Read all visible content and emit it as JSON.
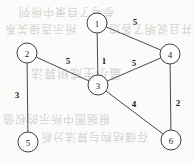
{
  "figure": {
    "width": 194,
    "height": 164,
    "background_color": "#fbfbfa",
    "node_fill_color": "#ffffff",
    "node_stroke_color": "#3f3f3f",
    "edge_color": "#4b4b4b",
    "label_color": "#1f1f1f"
  },
  "chart_data": {
    "type": "diagram",
    "subtype": "node-link-graph",
    "directed": false,
    "weighted": true,
    "title": "",
    "nodes": [
      {
        "id": "1",
        "label": "1",
        "x": 97,
        "y": 23,
        "r": 10
      },
      {
        "id": "2",
        "label": "2",
        "x": 27,
        "y": 53,
        "r": 10
      },
      {
        "id": "3",
        "label": "3",
        "x": 98,
        "y": 85,
        "r": 10
      },
      {
        "id": "4",
        "label": "4",
        "x": 170,
        "y": 54,
        "r": 10
      },
      {
        "id": "5",
        "label": "5",
        "x": 28,
        "y": 142,
        "r": 10
      },
      {
        "id": "6",
        "label": "6",
        "x": 171,
        "y": 140,
        "r": 10
      }
    ],
    "edges": [
      {
        "source": "1",
        "target": "4",
        "weight": 5,
        "label": "5",
        "label_x": 135,
        "label_y": 22
      },
      {
        "source": "1",
        "target": "3",
        "weight": 1,
        "label": "1",
        "label_x": 104,
        "label_y": 61
      },
      {
        "source": "2",
        "target": "3",
        "weight": 5,
        "label": "5",
        "label_x": 68,
        "label_y": 61
      },
      {
        "source": "2",
        "target": "5",
        "weight": 3,
        "label": "3",
        "label_x": 17,
        "label_y": 95
      },
      {
        "source": "3",
        "target": "4",
        "weight": 5,
        "label": "5",
        "label_x": 134,
        "label_y": 63
      },
      {
        "source": "3",
        "target": "6",
        "weight": 4,
        "label": "4",
        "label_x": 134,
        "label_y": 104
      },
      {
        "source": "4",
        "target": "6",
        "weight": 2,
        "label": "2",
        "label_x": 178,
        "label_y": 103
      }
    ],
    "legend": [],
    "annotations": []
  },
  "ghost_marks": [
    {
      "text": "参考了目录中所列",
      "x": 18,
      "y": 5,
      "size": 11,
      "rotate": 180
    },
    {
      "text": "所示连接关系",
      "x": 4,
      "y": 22,
      "size": 11,
      "rotate": 180
    },
    {
      "text": "并且说明了各边",
      "x": 108,
      "y": 22,
      "size": 11,
      "rotate": 180
    },
    {
      "text": "最小生成树算法",
      "x": 30,
      "y": 66,
      "size": 12,
      "rotate": 180
    },
    {
      "text": "根据图中所示的权值",
      "x": 2,
      "y": 112,
      "size": 11,
      "rotate": 180
    },
    {
      "text": "存储结构与算法分析",
      "x": 40,
      "y": 130,
      "size": 11,
      "rotate": 180
    }
  ]
}
